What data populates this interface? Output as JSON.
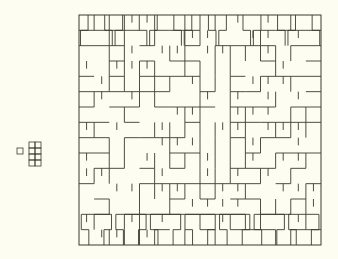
{
  "figure": {
    "background": "#fdfdf2",
    "stroke": "#3a3a30",
    "piece": {
      "description": "small polyomino: single square attached to a 2x4 block",
      "unit": 6,
      "origin": [
        17,
        142
      ],
      "cells": [
        [
          0,
          1
        ],
        [
          2,
          0
        ],
        [
          3,
          0
        ],
        [
          2,
          1
        ],
        [
          3,
          1
        ],
        [
          2,
          2
        ],
        [
          3,
          2
        ],
        [
          2,
          3
        ],
        [
          3,
          3
        ]
      ]
    },
    "tiling": {
      "box": {
        "x": 79,
        "y": 15,
        "width": 242,
        "height": 230
      },
      "cols": 7,
      "rows": 7,
      "description": "square region tiled with T-shaped pieces"
    }
  }
}
